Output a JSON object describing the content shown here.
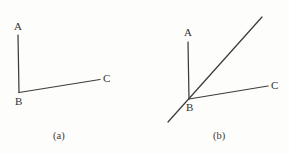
{
  "figure": {
    "background_color": "#fdfdfc",
    "stroke_color": "#3c3c3c",
    "text_color": "#33322f",
    "width": 289,
    "height": 154
  },
  "panels": [
    {
      "id": "a",
      "caption": "(a)",
      "description": "A right-angle-like corner: ray BA points up, ray BC points right and slightly up from the vertex B.",
      "labels": {
        "A": "A",
        "B": "B",
        "C": "C"
      },
      "vertex": {
        "x": 19.5,
        "y": 92.5
      },
      "segments": [
        {
          "name": "segment-BA",
          "x1": 19.0,
          "y1": 92.5,
          "x2": 18.0,
          "y2": 35.0
        },
        {
          "name": "segment-BC",
          "x1": 19.0,
          "y1": 92.5,
          "x2": 100.0,
          "y2": 79.5
        }
      ]
    },
    {
      "id": "b",
      "caption": "(b)",
      "description": "Same corner as (a) with an extra full line drawn through the vertex B, running from lower-left up to the upper-right.",
      "labels": {
        "A": "A",
        "B": "B",
        "C": "C"
      },
      "vertex": {
        "x": 189.0,
        "y": 99.0
      },
      "segments": [
        {
          "name": "segment-BA",
          "x1": 189.0,
          "y1": 99.0,
          "x2": 188.0,
          "y2": 42.0
        },
        {
          "name": "segment-BC",
          "x1": 189.0,
          "y1": 99.0,
          "x2": 268.0,
          "y2": 86.0
        },
        {
          "name": "transversal-line",
          "x1": 168.0,
          "y1": 122.0,
          "x2": 262.0,
          "y2": 17.0
        }
      ]
    }
  ]
}
